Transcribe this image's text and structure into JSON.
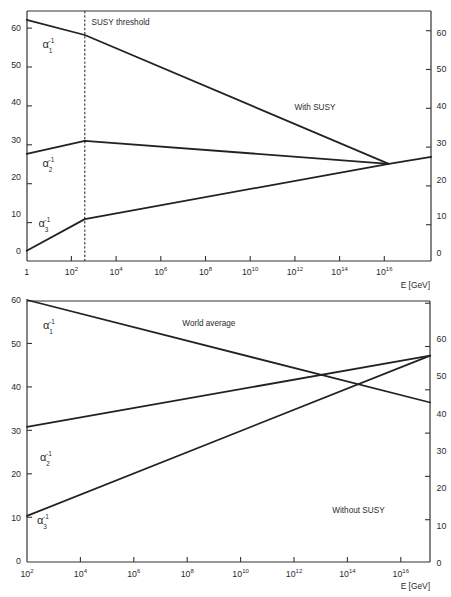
{
  "chart_data": [
    {
      "panel": "top",
      "type": "line",
      "title": "",
      "xlabel": "E [GeV]",
      "ylabel": "",
      "x_scale": "log10",
      "xlim_log10": [
        0,
        18.1
      ],
      "ylim": [
        -2.8,
        64.6
      ],
      "grid": false,
      "legend": "none",
      "x_ticks": [
        {
          "log10": 0,
          "base": "1",
          "exp": ""
        },
        {
          "log10": 2,
          "base": "10",
          "exp": "2"
        },
        {
          "log10": 4,
          "base": "10",
          "exp": "4"
        },
        {
          "log10": 6,
          "base": "10",
          "exp": "6"
        },
        {
          "log10": 8,
          "base": "10",
          "exp": "8"
        },
        {
          "log10": 10,
          "base": "10",
          "exp": "10"
        },
        {
          "log10": 12,
          "base": "10",
          "exp": "12"
        },
        {
          "log10": 14,
          "base": "10",
          "exp": "14"
        },
        {
          "log10": 16,
          "base": "10",
          "exp": "16"
        }
      ],
      "y_ticks_left": [
        0,
        10,
        20,
        30,
        40,
        50,
        60
      ],
      "y_ticks_right": [
        0,
        10,
        20,
        30,
        40,
        50,
        60
      ],
      "threshold": {
        "label": "SUSY threshold",
        "log10E": 2.6,
        "style": "dashed"
      },
      "annotations": [
        "With SUSY"
      ],
      "series": [
        {
          "name": "alpha1_inverse",
          "label": {
            "symbol": "α",
            "sup": "-1",
            "sub": "1"
          },
          "x_log10": [
            0,
            2.6,
            16.2
          ],
          "y": [
            62.2,
            58.1,
            23.4
          ]
        },
        {
          "name": "alpha2_inverse",
          "label": {
            "symbol": "α",
            "sup": "-1",
            "sub": "2"
          },
          "x_log10": [
            0,
            2.6,
            16.2
          ],
          "y": [
            26.1,
            29.6,
            23.4
          ]
        },
        {
          "name": "alpha3_inverse",
          "label": {
            "symbol": "α",
            "sup": "-1",
            "sub": "3"
          },
          "x_log10": [
            0,
            2.6,
            16.2,
            18.1
          ],
          "y": [
            0.0,
            8.5,
            23.4,
            25.3
          ]
        }
      ]
    },
    {
      "panel": "bottom",
      "type": "line",
      "title": "",
      "xlabel": "E [GeV]",
      "ylabel": "",
      "x_scale": "log10",
      "xlim_log10": [
        2,
        17.1
      ],
      "ylim": [
        -0.3,
        60
      ],
      "grid": false,
      "legend": "none",
      "x_ticks": [
        {
          "log10": 2,
          "base": "10",
          "exp": "2"
        },
        {
          "log10": 4,
          "base": "10",
          "exp": "4"
        },
        {
          "log10": 6,
          "base": "10",
          "exp": "6"
        },
        {
          "log10": 8,
          "base": "10",
          "exp": "8"
        },
        {
          "log10": 10,
          "base": "10",
          "exp": "10"
        },
        {
          "log10": 12,
          "base": "10",
          "exp": "12"
        },
        {
          "log10": 14,
          "base": "10",
          "exp": "14"
        },
        {
          "log10": 16,
          "base": "10",
          "exp": "16"
        }
      ],
      "y_ticks_left": [
        0,
        10,
        20,
        30,
        40,
        50,
        60
      ],
      "y_ticks_right": [
        0,
        10,
        20,
        30,
        40,
        50,
        60
      ],
      "annotations": [
        "World average",
        "Without SUSY"
      ],
      "series": [
        {
          "name": "alpha1_inverse",
          "label": {
            "symbol": "α",
            "sup": "-1",
            "sub": "1"
          },
          "x_log10": [
            2,
            17.1
          ],
          "y": [
            60.0,
            36.4
          ]
        },
        {
          "name": "alpha2_inverse",
          "label": {
            "symbol": "α",
            "sup": "-1",
            "sub": "2"
          },
          "x_log10": [
            2,
            17.1
          ],
          "y": [
            30.8,
            47.2
          ]
        },
        {
          "name": "alpha3_inverse",
          "label": {
            "symbol": "α",
            "sup": "-1",
            "sub": "3"
          },
          "x_log10": [
            2,
            17.1
          ],
          "y": [
            10.3,
            47.2
          ]
        }
      ]
    }
  ]
}
